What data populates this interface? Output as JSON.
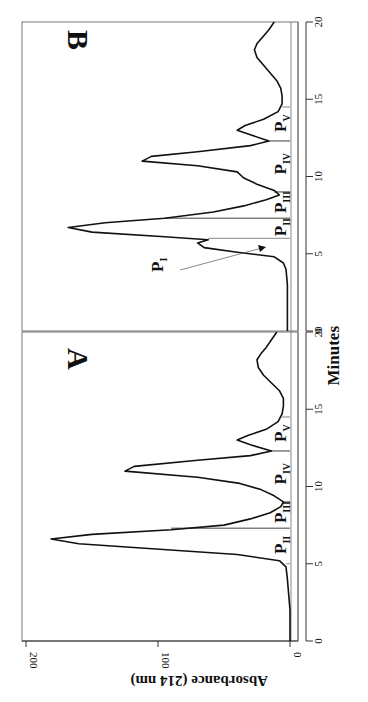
{
  "chart_data": [
    {
      "type": "line",
      "panel": "A",
      "xlabel": "Minutes",
      "ylabel": "Absorbance (214 nm)",
      "xlim": [
        0,
        20
      ],
      "ylim": [
        0,
        200
      ],
      "xticks": [
        0,
        5,
        10,
        15,
        20
      ],
      "yticks": [
        0,
        100,
        200
      ],
      "orientation": "rotated 90° clockwise",
      "peak_regions": [
        {
          "label": "P",
          "sub": "II",
          "start": 5.0,
          "end": 7.3
        },
        {
          "label": "P",
          "sub": "III",
          "start": 7.3,
          "end": 9.0
        },
        {
          "label": "P",
          "sub": "IV",
          "start": 9.0,
          "end": 12.3
        },
        {
          "label": "P",
          "sub": "V",
          "start": 12.3,
          "end": 14.5
        }
      ],
      "x": [
        0,
        1,
        2,
        3,
        4,
        4.8,
        5.2,
        5.6,
        6.0,
        6.3,
        6.6,
        6.9,
        7.2,
        7.5,
        7.9,
        8.3,
        8.7,
        9.0,
        9.4,
        9.8,
        10.2,
        10.6,
        11.0,
        11.3,
        11.7,
        12.0,
        12.3,
        12.7,
        13.0,
        13.3,
        13.7,
        14.2,
        14.7,
        15.2,
        15.7,
        16.2,
        16.7,
        17.2,
        17.7,
        18.2,
        18.6,
        19.0,
        19.5,
        20.0
      ],
      "values": [
        0,
        0,
        0,
        1,
        2,
        3,
        8,
        40,
        110,
        160,
        181,
        150,
        90,
        50,
        30,
        15,
        7,
        5,
        12,
        22,
        38,
        70,
        125,
        118,
        70,
        30,
        14,
        30,
        40,
        32,
        18,
        9,
        6,
        5,
        5,
        8,
        14,
        20,
        24,
        25,
        22,
        18,
        14,
        10
      ]
    },
    {
      "type": "line",
      "panel": "B",
      "xlabel": "Minutes",
      "ylabel": "Absorbance (214 nm)",
      "xlim": [
        0,
        20
      ],
      "ylim": [
        0,
        200
      ],
      "xticks": [
        0,
        5,
        10,
        15,
        20
      ],
      "orientation": "rotated 90° clockwise",
      "annotations": [
        {
          "text": "P_I",
          "points_to_minute": 5.3,
          "arrow": true
        }
      ],
      "peak_regions": [
        {
          "label": "P",
          "sub": "II",
          "start": 6.0,
          "end": 7.3
        },
        {
          "label": "P",
          "sub": "III",
          "start": 7.3,
          "end": 9.0
        },
        {
          "label": "P",
          "sub": "IV",
          "start": 9.0,
          "end": 12.3
        },
        {
          "label": "P",
          "sub": "V",
          "start": 12.3,
          "end": 14.5
        }
      ],
      "x": [
        0,
        1,
        2,
        3,
        4,
        4.4,
        4.8,
        5.1,
        5.4,
        5.7,
        5.9,
        6.1,
        6.4,
        6.7,
        7.0,
        7.3,
        7.7,
        8.1,
        8.5,
        8.8,
        9.1,
        9.5,
        9.9,
        10.3,
        10.7,
        11.0,
        11.3,
        11.6,
        12.0,
        12.3,
        12.7,
        13.0,
        13.3,
        13.7,
        14.2,
        14.7,
        15.2,
        15.7,
        16.2,
        16.7,
        17.2,
        17.7,
        18.2,
        18.6,
        19.0,
        19.5,
        20.0
      ],
      "values": [
        2,
        2,
        2,
        2,
        3,
        5,
        12,
        40,
        65,
        70,
        62,
        95,
        150,
        168,
        140,
        95,
        58,
        35,
        18,
        8,
        12,
        25,
        35,
        40,
        70,
        112,
        105,
        70,
        30,
        16,
        30,
        40,
        34,
        20,
        9,
        6,
        6,
        7,
        10,
        15,
        20,
        25,
        27,
        25,
        21,
        16,
        12
      ]
    }
  ],
  "figure": {
    "panel_a_letter": "A",
    "panel_b_letter": "B",
    "x_axis_title": "Minutes",
    "y_axis_title": "Absorbance (214 nm)",
    "y_tick_labels": [
      "0",
      "100",
      "200"
    ],
    "x_tick_labels_a": [
      "0",
      "5",
      "10",
      "15",
      "20"
    ],
    "x_tick_labels_b": [
      "0",
      "5",
      "10",
      "15",
      "20"
    ],
    "p_i_label": "P",
    "p_i_sub": "I"
  }
}
